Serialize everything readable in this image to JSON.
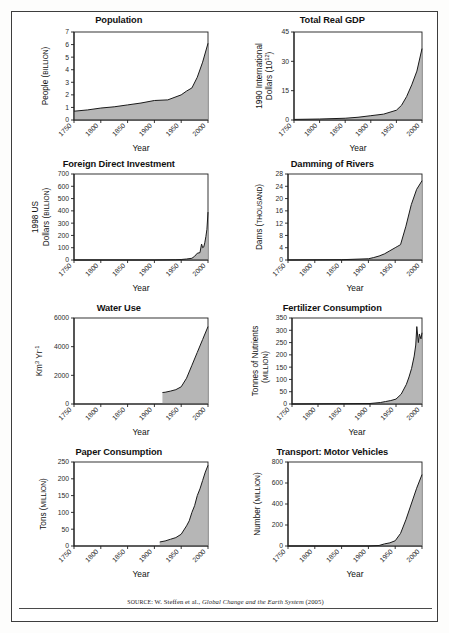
{
  "figure": {
    "source_prefix": "SOURCE:",
    "source_author": " W. Steffen et al., ",
    "source_title": "Global Change and the Earth System",
    "source_year": " (2005)",
    "xlabel": "Year",
    "accent_fill": "#b0b0b0",
    "line_color": "#1a1a1a",
    "frame_color": "#3d3d3d"
  },
  "chart_data": [
    {
      "type": "area",
      "title": "Population",
      "xlabel": "Year",
      "ylabel": "People (BILLION)",
      "ylabel_main": "People (",
      "ylabel_small": "BILLION",
      "ylabel_tail": ")",
      "xlim": [
        1750,
        2000
      ],
      "ylim": [
        0,
        7
      ],
      "xticks": [
        1750,
        1800,
        1850,
        1900,
        1950,
        2000
      ],
      "yticks": [
        0,
        1,
        2,
        3,
        4,
        5,
        6,
        7
      ],
      "grid": false,
      "legend": "none",
      "x": [
        1750,
        1775,
        1800,
        1825,
        1850,
        1875,
        1900,
        1925,
        1950,
        1960,
        1970,
        1980,
        1990,
        2000
      ],
      "values": [
        0.7,
        0.8,
        0.95,
        1.05,
        1.2,
        1.35,
        1.55,
        1.6,
        2.0,
        2.3,
        2.55,
        3.4,
        4.6,
        6.1
      ]
    },
    {
      "type": "area",
      "title": "Total Real GDP",
      "xlabel": "Year",
      "ylabel": "1990 International Dollars (10^12)",
      "ylabel_line1": "1990 International",
      "ylabel_line2_main": "Dollars (10",
      "ylabel_line2_sup": "12",
      "ylabel_line2_tail": ")",
      "xlim": [
        1750,
        2000
      ],
      "ylim": [
        0,
        45
      ],
      "xticks": [
        1750,
        1800,
        1850,
        1900,
        1950,
        2000
      ],
      "yticks": [
        0,
        15,
        30,
        45
      ],
      "grid": false,
      "legend": "none",
      "x": [
        1750,
        1800,
        1850,
        1875,
        1900,
        1925,
        1950,
        1960,
        1970,
        1980,
        1990,
        2000
      ],
      "values": [
        0.3,
        0.5,
        0.9,
        1.4,
        2.2,
        3.0,
        5.0,
        7.5,
        12.0,
        18.0,
        25.0,
        36.5
      ]
    },
    {
      "type": "area",
      "title": "Foreign Direct Investment",
      "xlabel": "Year",
      "ylabel": "1998 US Dollars (BILLION)",
      "ylabel_line1": "1998 US",
      "ylabel_line2_main": "Dollars (",
      "ylabel_line2_small": "BILLION",
      "ylabel_line2_tail": ")",
      "xlim": [
        1750,
        2000
      ],
      "ylim": [
        0,
        700
      ],
      "xticks": [
        1750,
        1800,
        1850,
        1900,
        1950,
        2000
      ],
      "yticks": [
        0,
        100,
        200,
        300,
        400,
        500,
        600,
        700
      ],
      "grid": false,
      "legend": "none",
      "x": [
        1750,
        1900,
        1940,
        1950,
        1960,
        1970,
        1975,
        1980,
        1985,
        1988,
        1990,
        1992,
        1994,
        1996,
        1998,
        2000
      ],
      "values": [
        0,
        0,
        2,
        4,
        8,
        14,
        30,
        55,
        60,
        130,
        100,
        105,
        140,
        190,
        250,
        390
      ]
    },
    {
      "type": "area",
      "title": "Damming of Rivers",
      "xlabel": "Year",
      "ylabel": "Dams (THOUSAND)",
      "ylabel_main": "Dams (",
      "ylabel_small": "THOUSAND",
      "ylabel_tail": ")",
      "xlim": [
        1750,
        2000
      ],
      "ylim": [
        0,
        28
      ],
      "xticks": [
        1750,
        1800,
        1850,
        1900,
        1950,
        2000
      ],
      "yticks": [
        0,
        4,
        8,
        12,
        16,
        20,
        24,
        28
      ],
      "grid": false,
      "legend": "none",
      "x": [
        1750,
        1850,
        1900,
        1910,
        1920,
        1930,
        1940,
        1950,
        1955,
        1960,
        1970,
        1980,
        1990,
        2000
      ],
      "values": [
        0,
        0.1,
        0.4,
        0.8,
        1.3,
        2.0,
        3.0,
        4.0,
        4.5,
        5.0,
        11.0,
        18.0,
        23.0,
        25.8
      ]
    },
    {
      "type": "area",
      "title": "Water Use",
      "xlabel": "Year",
      "ylabel": "Km^3 Yr^-1",
      "ylabel_main": "Km",
      "ylabel_sup1": "3",
      "ylabel_mid": " Yr",
      "ylabel_sup2": "-1",
      "xlim": [
        1750,
        2000
      ],
      "ylim": [
        0,
        6000
      ],
      "xticks": [
        1750,
        1800,
        1850,
        1900,
        1950,
        2000
      ],
      "yticks": [
        0,
        2000,
        4000,
        6000
      ],
      "grid": false,
      "legend": "none",
      "x": [
        1915,
        1920,
        1930,
        1940,
        1950,
        1960,
        1970,
        1980,
        1990,
        2000
      ],
      "values": [
        800,
        820,
        900,
        1000,
        1200,
        1800,
        2700,
        3600,
        4500,
        5400
      ]
    },
    {
      "type": "area",
      "title": "Fertilizer Consumption",
      "xlabel": "Year",
      "ylabel": "Tonnes of Nutrients (MILLION)",
      "ylabel_line1": "Tonnes of Nutrients",
      "ylabel_line2_open": "(",
      "ylabel_line2_small": "MILLION",
      "ylabel_line2_tail": ")",
      "xlim": [
        1750,
        2000
      ],
      "ylim": [
        0,
        350
      ],
      "xticks": [
        1750,
        1800,
        1850,
        1900,
        1950,
        2000
      ],
      "yticks": [
        0,
        50,
        100,
        150,
        200,
        250,
        300,
        350
      ],
      "grid": false,
      "legend": "none",
      "x": [
        1750,
        1900,
        1920,
        1930,
        1940,
        1950,
        1960,
        1970,
        1975,
        1980,
        1985,
        1988,
        1990,
        1993,
        1995,
        1998,
        2000
      ],
      "values": [
        0,
        2,
        6,
        10,
        14,
        20,
        40,
        80,
        110,
        145,
        195,
        240,
        315,
        250,
        285,
        265,
        290
      ]
    },
    {
      "type": "area",
      "title": "Paper Consumption",
      "xlabel": "Year",
      "ylabel": "Tons (MILLION)",
      "ylabel_main": "Tons (",
      "ylabel_small": "MILLION",
      "ylabel_tail": ")",
      "xlim": [
        1750,
        2000
      ],
      "ylim": [
        0,
        250
      ],
      "xticks": [
        1750,
        1800,
        1850,
        1900,
        1950,
        2000
      ],
      "yticks": [
        0,
        50,
        100,
        150,
        200,
        250
      ],
      "grid": false,
      "legend": "none",
      "x": [
        1910,
        1920,
        1930,
        1940,
        1950,
        1960,
        1965,
        1970,
        1975,
        1980,
        1985,
        1990,
        1995,
        2000
      ],
      "values": [
        12,
        15,
        20,
        25,
        35,
        60,
        75,
        100,
        120,
        150,
        170,
        195,
        220,
        240
      ]
    },
    {
      "type": "area",
      "title": "Transport: Motor Vehicles",
      "xlabel": "Year",
      "ylabel": "Number (MILLION)",
      "ylabel_main": "Number (",
      "ylabel_small": "MILLION",
      "ylabel_tail": ")",
      "xlim": [
        1750,
        2000
      ],
      "ylim": [
        0,
        800
      ],
      "xticks": [
        1750,
        1800,
        1850,
        1900,
        1950,
        2000
      ],
      "yticks": [
        0,
        200,
        400,
        600,
        800
      ],
      "grid": false,
      "legend": "none",
      "x": [
        1750,
        1900,
        1920,
        1930,
        1940,
        1950,
        1960,
        1970,
        1980,
        1990,
        2000
      ],
      "values": [
        0,
        0,
        5,
        20,
        30,
        50,
        120,
        250,
        400,
        550,
        680
      ]
    }
  ]
}
